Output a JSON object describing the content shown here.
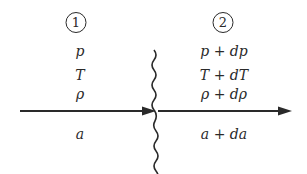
{
  "diagram": {
    "region1": {
      "marker": "1",
      "labels": [
        "p",
        "T",
        "ρ",
        "a"
      ]
    },
    "region2": {
      "marker": "2",
      "labels": [
        "p + dp",
        "T + dT",
        "ρ + dρ",
        "a + da"
      ]
    },
    "elements": {
      "wave_front": "wavy vertical line",
      "arrows": [
        "incoming flow arrow (left)",
        "outgoing flow arrow (right)"
      ]
    }
  }
}
